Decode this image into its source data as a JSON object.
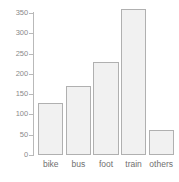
{
  "chart_data": {
    "type": "bar",
    "title": "",
    "subtitle": "",
    "xlabel": "",
    "ylabel": "",
    "categories": [
      "bike",
      "bus",
      "foot",
      "train",
      "others"
    ],
    "values": [
      128,
      170,
      230,
      360,
      62
    ],
    "ylim": [
      0,
      375
    ],
    "yticks": [
      0,
      50,
      100,
      150,
      200,
      250,
      300,
      350
    ],
    "ytick_labels": [
      "0",
      "50",
      "100",
      "150",
      "200",
      "250",
      "300",
      "350"
    ],
    "grid": false,
    "legend": null,
    "annotations": [],
    "colors": {
      "bar_fill": "#f1f1f1",
      "bar_border": "#b0b0b0",
      "axis": "#b9b9b9",
      "tick_text": "#8a8a8a",
      "category_text": "#6f6f6f",
      "background": "#ffffff"
    }
  }
}
